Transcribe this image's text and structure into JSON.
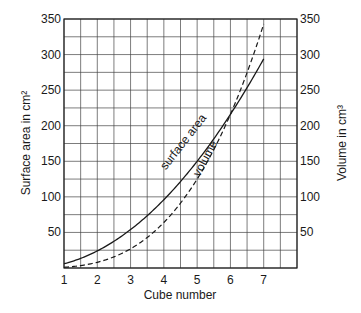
{
  "chart_data": {
    "type": "line",
    "title": "",
    "xlabel": "Cube number",
    "ylabel": "Surface area in cm²",
    "y2label": "Volume in cm³",
    "xlim": [
      1,
      8
    ],
    "ylim": [
      0,
      350
    ],
    "y2lim": [
      0,
      350
    ],
    "grid": true,
    "grid_x_step": 0.5,
    "grid_y_step": 25,
    "x_ticks": [
      1,
      2,
      3,
      4,
      5,
      6,
      7
    ],
    "y_ticks": [
      50,
      100,
      150,
      200,
      250,
      300,
      350
    ],
    "y2_ticks": [
      50,
      100,
      150,
      200,
      250,
      300,
      350
    ],
    "x": [
      1,
      1.5,
      2,
      2.5,
      3,
      3.5,
      4,
      4.5,
      5,
      5.5,
      6,
      6.5,
      7
    ],
    "series": [
      {
        "name": "surface area",
        "axis": "left",
        "style": "solid",
        "formula": "6n²",
        "values": [
          6,
          13.5,
          24,
          37.5,
          54,
          73.5,
          96,
          121.5,
          150,
          181.5,
          216,
          253.5,
          294
        ]
      },
      {
        "name": "volume",
        "axis": "right",
        "style": "dashed",
        "formula": "n³",
        "values": [
          1,
          3.375,
          8,
          15.625,
          27,
          42.875,
          64,
          91.125,
          125,
          166.375,
          216,
          274.625,
          343
        ]
      }
    ],
    "annotations": [
      {
        "text": "surface area",
        "near_x": 4.9,
        "near_y": 165,
        "rotation": -52
      },
      {
        "text": "volume",
        "near_x": 5.55,
        "near_y": 150,
        "rotation": -62
      }
    ],
    "crossover": {
      "x": 6,
      "y": 216
    },
    "legend": "none (inline curve labels)"
  },
  "labels": {
    "x_axis": "Cube number",
    "y_left": "Surface area in cm²",
    "y_right": "Volume in cm³",
    "surface_curve": "surface area",
    "volume_curve": "volume"
  }
}
